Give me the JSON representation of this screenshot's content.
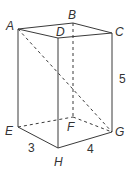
{
  "diagram": {
    "vertices": {
      "A": {
        "label": "A",
        "x": 18,
        "y": 29
      },
      "B": {
        "label": "B",
        "x": 73,
        "y": 23
      },
      "C": {
        "label": "C",
        "x": 112,
        "y": 33
      },
      "D": {
        "label": "D",
        "x": 58,
        "y": 38
      },
      "E": {
        "label": "E",
        "x": 18,
        "y": 127
      },
      "F": {
        "label": "F",
        "x": 73,
        "y": 117
      },
      "G": {
        "label": "G",
        "x": 112,
        "y": 132
      },
      "H": {
        "label": "H",
        "x": 58,
        "y": 148
      }
    },
    "measurements": {
      "EH": "3",
      "HG": "4",
      "CG": "5"
    },
    "visible_edges": [
      "AB",
      "BC",
      "CD",
      "DA",
      "AE",
      "DH",
      "CG",
      "EH",
      "HG"
    ],
    "hidden_edges": [
      "BF",
      "EF",
      "FG",
      "AG",
      "FD"
    ]
  }
}
